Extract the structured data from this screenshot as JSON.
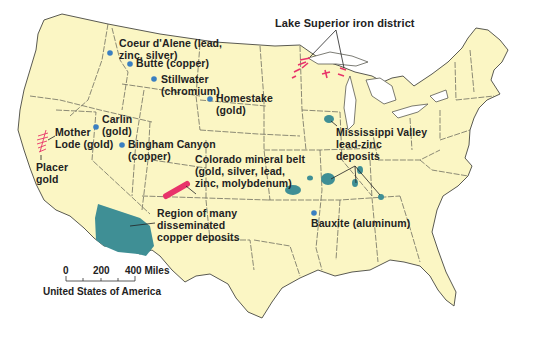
{
  "map": {
    "title": "United States of America",
    "colors": {
      "land": "#fbf6c4",
      "border": "#5a5a52",
      "ocean": "#ffffff",
      "deposit_region": "#3f8f95",
      "point": "#3a7fc1",
      "iron_belt": "#e8336a"
    },
    "labels": {
      "coeur": "Coeur d'Alene (lead,\nzinc, silver)",
      "butte": "Butte (copper)",
      "stillwater": "Stillwater\n(chromium)",
      "homestake": "Homestake\n(gold)",
      "carlin": "Carlin\n(gold)",
      "mother_lode": "Mother\nLode (gold)",
      "bingham": "Bingham Canyon\n(copper)",
      "placer": "Placer\ngold",
      "colorado": "Colorado mineral belt\n(gold, silver, lead,\nzinc, molybdenum)",
      "copper_region": "Region of many\ndisseminated\ncopper deposits",
      "lake_superior": "Lake Superior iron district",
      "mississippi": "Mississippi Valley\nlead-zinc\ndeposits",
      "bauxite": "Bauxite (aluminum)"
    },
    "scale": {
      "ticks": [
        "0",
        "200",
        "400 Miles"
      ],
      "caption": "United States of America"
    }
  }
}
